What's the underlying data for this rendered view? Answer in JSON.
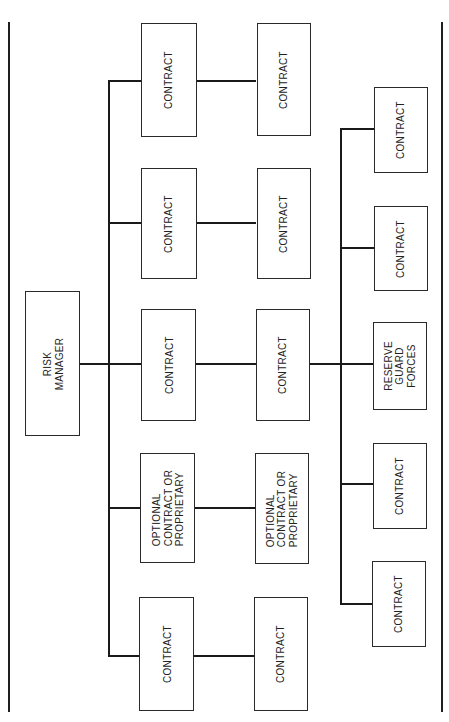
{
  "diagram": {
    "root": {
      "lines": [
        "RISK",
        "MANAGER"
      ]
    },
    "left_branch": {
      "rows": [
        {
          "primary": {
            "lines": [
              "CONTRACT"
            ]
          },
          "secondary": {
            "lines": [
              "CONTRACT"
            ]
          }
        },
        {
          "primary": {
            "lines": [
              "CONTRACT"
            ]
          },
          "secondary": {
            "lines": [
              "CONTRACT"
            ]
          }
        },
        {
          "primary": {
            "lines": [
              "CONTRACT"
            ]
          },
          "secondary": {
            "lines": [
              "CONTRACT"
            ]
          }
        },
        {
          "primary": {
            "lines": [
              "OPTIONAL",
              "CONTRACT OR",
              "PROPRIETARY"
            ]
          },
          "secondary": {
            "lines": [
              "OPTIONAL",
              "CONTRACT OR",
              "PROPRIETARY"
            ]
          }
        },
        {
          "primary": {
            "lines": [
              "CONTRACT"
            ]
          },
          "secondary": {
            "lines": [
              "CONTRACT"
            ]
          }
        }
      ]
    },
    "right_branch": {
      "nodes": [
        {
          "lines": [
            "CONTRACT"
          ]
        },
        {
          "lines": [
            "CONTRACT"
          ]
        },
        {
          "lines": [
            "RESERVE",
            "GUARD",
            "FORCES"
          ]
        },
        {
          "lines": [
            "CONTRACT"
          ]
        },
        {
          "lines": [
            "CONTRACT"
          ]
        }
      ]
    },
    "colors": {
      "background": "#ffffff",
      "line": "#1a1a1a",
      "box_border": "#2a2a2a",
      "text": "#222222"
    }
  }
}
